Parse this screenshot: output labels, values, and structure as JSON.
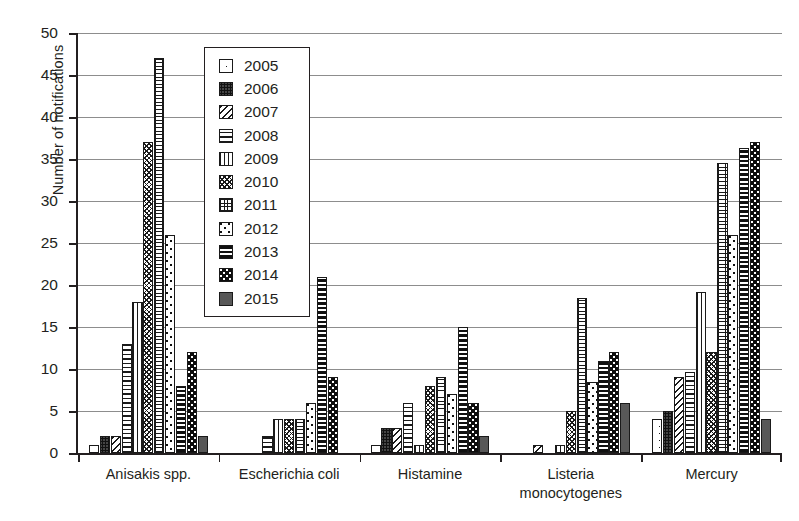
{
  "chart_data": {
    "type": "bar",
    "title": "",
    "xlabel": "",
    "ylabel": "Number of notifications",
    "ylim": [
      0,
      50
    ],
    "ytick_labels": [
      "0",
      "5",
      "10",
      "15",
      "20",
      "25",
      "30",
      "35",
      "40",
      "45",
      "50"
    ],
    "ytick_values": [
      0,
      5,
      10,
      15,
      20,
      25,
      30,
      35,
      40,
      45,
      50
    ],
    "grid": true,
    "legend_position": "upper-left-inside",
    "categories": [
      "Anisakis spp.",
      "Escherichia coli",
      "Histamine",
      "Listeria\nmonocytogenes",
      "Mercury"
    ],
    "series": [
      {
        "name": "2005",
        "pattern": "sparse-fine-dots",
        "values": [
          1,
          0,
          1,
          0,
          4
        ]
      },
      {
        "name": "2006",
        "pattern": "dense-checker-dots",
        "values": [
          2,
          0,
          3,
          0,
          5
        ]
      },
      {
        "name": "2007",
        "pattern": "diagonal-stripes",
        "values": [
          2,
          0,
          3,
          1,
          9
        ]
      },
      {
        "name": "2008",
        "pattern": "horizontal-lines",
        "values": [
          13,
          2,
          6,
          0,
          9.7
        ]
      },
      {
        "name": "2009",
        "pattern": "vertical-lines",
        "values": [
          18,
          4,
          1,
          1,
          19.2
        ]
      },
      {
        "name": "2010",
        "pattern": "wavy-cross-hatch",
        "values": [
          37,
          4,
          8,
          5,
          12
        ]
      },
      {
        "name": "2011",
        "pattern": "square-grid",
        "values": [
          47,
          4,
          9,
          18.5,
          34.5
        ]
      },
      {
        "name": "2012",
        "pattern": "scattered-dots",
        "values": [
          26,
          6,
          7,
          8.5,
          26
        ]
      },
      {
        "name": "2013",
        "pattern": "thick-horizontal-bands",
        "values": [
          8,
          21,
          15,
          11,
          36.3
        ]
      },
      {
        "name": "2014",
        "pattern": "black-speckled",
        "values": [
          12,
          9,
          6,
          12,
          37
        ]
      },
      {
        "name": "2015",
        "pattern": "solid-grey",
        "values": [
          2,
          0,
          2,
          6,
          4
        ]
      }
    ]
  },
  "colors": {
    "axis": "#231f20",
    "gridline": "#8d8d8d",
    "bar_outline": "#1a1a1a",
    "background": "#ffffff"
  }
}
